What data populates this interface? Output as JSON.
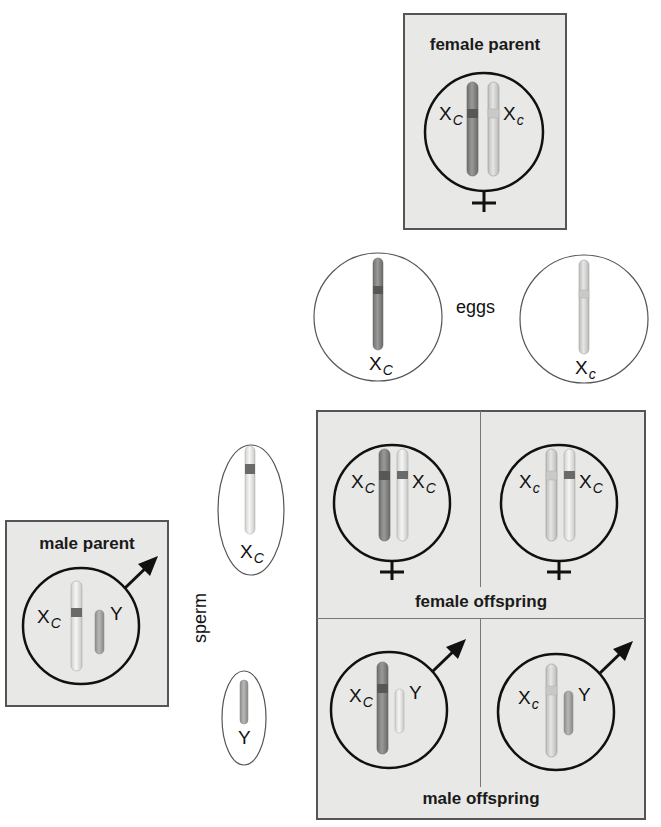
{
  "colors": {
    "box_fill": "#e8e8e6",
    "box_border": "#555555",
    "dominant_chrom": "#8a8a88",
    "dominant_band": "#5a5a58",
    "recessive_chrom": "#d6d6d4",
    "recessive_band": "#c4c4c2",
    "white_chrom": "#ececea",
    "y_chrom": "#a8a8a6"
  },
  "female_parent": {
    "title": "female parent",
    "chromosomes": [
      {
        "label": "X",
        "allele": "C",
        "type": "dominant"
      },
      {
        "label": "X",
        "allele": "c",
        "type": "recessive"
      }
    ],
    "symbol": "female-symbol"
  },
  "eggs": {
    "label": "eggs",
    "cells": [
      {
        "label": "X",
        "allele": "C",
        "type": "dominant"
      },
      {
        "label": "X",
        "allele": "c",
        "type": "recessive"
      }
    ]
  },
  "male_parent": {
    "title": "male parent",
    "chromosomes": [
      {
        "label": "X",
        "allele": "C",
        "type": "dominant-white"
      },
      {
        "label": "Y",
        "allele": "",
        "type": "y"
      }
    ],
    "symbol": "male-symbol"
  },
  "sperm": {
    "label": "sperm",
    "cells": [
      {
        "label": "X",
        "allele": "C",
        "type": "dominant-white"
      },
      {
        "label": "Y",
        "allele": "",
        "type": "y"
      }
    ]
  },
  "offspring": {
    "female_label": "female offspring",
    "male_label": "male offspring",
    "female": [
      {
        "left": {
          "label": "X",
          "allele": "C"
        },
        "right": {
          "label": "X",
          "allele": "C"
        }
      },
      {
        "left": {
          "label": "X",
          "allele": "c"
        },
        "right": {
          "label": "X",
          "allele": "C"
        }
      }
    ],
    "male": [
      {
        "x": {
          "label": "X",
          "allele": "C"
        },
        "y": {
          "label": "Y"
        }
      },
      {
        "x": {
          "label": "X",
          "allele": "c"
        },
        "y": {
          "label": "Y"
        }
      }
    ]
  }
}
